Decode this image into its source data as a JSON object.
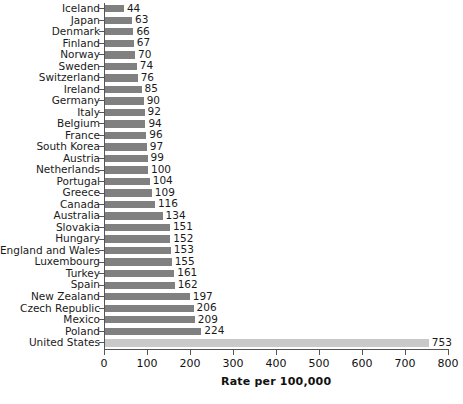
{
  "chart_data": {
    "type": "bar",
    "orientation": "horizontal",
    "title": "",
    "xlabel": "Rate per 100,000",
    "ylabel": "",
    "xlim": [
      0,
      800
    ],
    "xticks": [
      0,
      100,
      200,
      300,
      400,
      500,
      600,
      700,
      800
    ],
    "grid": false,
    "legend": null,
    "categories": [
      "Iceland",
      "Japan",
      "Denmark",
      "Finland",
      "Norway",
      "Sweden",
      "Switzerland",
      "Ireland",
      "Germany",
      "Italy",
      "Belgium",
      "France",
      "South Korea",
      "Austria",
      "Netherlands",
      "Portugal",
      "Greece",
      "Canada",
      "Australia",
      "Slovakia",
      "Hungary",
      "England and Wales",
      "Luxembourg",
      "Turkey",
      "Spain",
      "New Zealand",
      "Czech Republic",
      "Mexico",
      "Poland",
      "United States"
    ],
    "values": [
      44,
      63,
      66,
      67,
      70,
      74,
      76,
      85,
      90,
      92,
      94,
      96,
      97,
      99,
      100,
      104,
      109,
      116,
      134,
      151,
      152,
      153,
      155,
      161,
      162,
      197,
      206,
      209,
      224,
      753
    ],
    "value_labels": [
      "44",
      "63",
      "66",
      "67",
      "70",
      "74",
      "76",
      "85",
      "90",
      "92",
      "94",
      "96",
      "97",
      "99",
      "100",
      "104",
      "109",
      "116",
      "134",
      "151",
      "152",
      "153",
      "155",
      "161",
      "162",
      "197",
      "206",
      "209",
      "224",
      "753"
    ],
    "highlighted_category": "United States",
    "colors": {
      "bar": "#808080",
      "bar_highlight": "#c9c9c9",
      "axis": "#555555",
      "text": "#1a1a1a",
      "background": "#ffffff"
    }
  },
  "axis": {
    "x_tick_labels": [
      "0",
      "100",
      "200",
      "300",
      "400",
      "500",
      "600",
      "700",
      "800"
    ],
    "x_title": "Rate per 100,000"
  }
}
